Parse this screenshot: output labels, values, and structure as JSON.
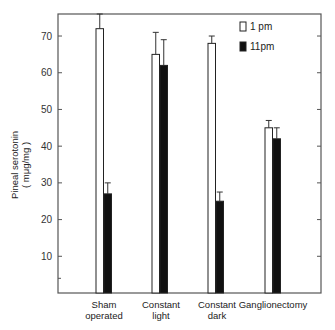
{
  "chart_data": {
    "type": "bar",
    "title": "",
    "xlabel": "",
    "ylabel": "Pineal serotonin",
    "ylabel_unit": "( mμg/mg )",
    "ylim": [
      0,
      76
    ],
    "yticks": [
      10,
      20,
      30,
      40,
      50,
      60,
      70
    ],
    "ytick_labels": [
      "10",
      "20",
      "30",
      "40",
      "50",
      "60",
      "70"
    ],
    "minor_ticks": [
      4
    ],
    "grid": false,
    "legend_position": "top-right",
    "categories": [
      {
        "line1": "Sham",
        "line2": "operated"
      },
      {
        "line1": "Constant",
        "line2": "light"
      },
      {
        "line1": "Constant",
        "line2": "dark"
      },
      {
        "line1": "Ganglionectomy",
        "line2": ""
      }
    ],
    "series": [
      {
        "name": "1 pm",
        "fill": "#ffffff",
        "values": [
          72,
          65,
          68,
          45
        ],
        "error": [
          4,
          6,
          2,
          2
        ]
      },
      {
        "name": "11pm",
        "fill": "#111111",
        "values": [
          27,
          62,
          25,
          42
        ],
        "error": [
          3,
          7,
          2.5,
          3
        ]
      }
    ]
  }
}
